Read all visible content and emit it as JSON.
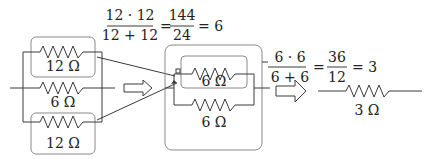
{
  "diagram": {
    "step1": {
      "resistors": [
        {
          "label": "12 Ω",
          "position": "top"
        },
        {
          "label": "6 Ω",
          "position": "middle"
        },
        {
          "label": "12 Ω",
          "position": "bottom"
        }
      ],
      "formula": {
        "numerator": "12 · 12",
        "denominator": "12 + 12",
        "equals1": "=",
        "result_numerator": "144",
        "result_denominator": "24",
        "equals2": "= 6"
      }
    },
    "step2": {
      "resistors": [
        {
          "label": "6 Ω",
          "position": "top"
        },
        {
          "label": "6 Ω",
          "position": "bottom"
        }
      ],
      "formula": {
        "numerator": "6 · 6",
        "denominator": "6 + 6",
        "equals1": "=",
        "result_numerator": "36",
        "result_denominator": "12",
        "equals2": "= 3"
      }
    },
    "step3": {
      "resistors": [
        {
          "label": "3 Ω",
          "position": "single"
        }
      ]
    },
    "colors": {
      "wire": "#3a3a3a",
      "box": "#8a8a8a",
      "text": "#222222"
    }
  }
}
